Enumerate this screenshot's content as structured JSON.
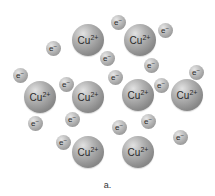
{
  "figure": {
    "label": "a.",
    "ion_text": "Cu",
    "ion_charge": "2+",
    "electron_text": "e",
    "electron_charge": "−"
  },
  "ions": [
    {
      "x": 88,
      "y": 40
    },
    {
      "x": 140,
      "y": 40
    },
    {
      "x": 40,
      "y": 97
    },
    {
      "x": 88,
      "y": 97
    },
    {
      "x": 138,
      "y": 95
    },
    {
      "x": 187,
      "y": 95
    },
    {
      "x": 88,
      "y": 152
    },
    {
      "x": 138,
      "y": 152
    }
  ],
  "electrons": [
    {
      "x": 118,
      "y": 22
    },
    {
      "x": 165,
      "y": 30
    },
    {
      "x": 53,
      "y": 48
    },
    {
      "x": 107,
      "y": 58
    },
    {
      "x": 151,
      "y": 65
    },
    {
      "x": 196,
      "y": 72
    },
    {
      "x": 20,
      "y": 75
    },
    {
      "x": 115,
      "y": 77
    },
    {
      "x": 66,
      "y": 84
    },
    {
      "x": 161,
      "y": 85
    },
    {
      "x": 35,
      "y": 123
    },
    {
      "x": 72,
      "y": 119
    },
    {
      "x": 119,
      "y": 127
    },
    {
      "x": 148,
      "y": 121
    },
    {
      "x": 180,
      "y": 137
    },
    {
      "x": 63,
      "y": 142
    }
  ]
}
